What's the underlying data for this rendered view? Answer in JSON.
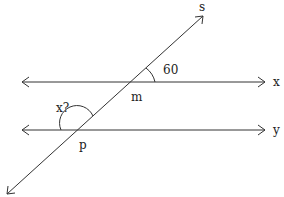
{
  "diagram": {
    "type": "parallel lines cut by a transversal",
    "colors": {
      "line": "#333333",
      "text": "#222222",
      "background": "#ffffff"
    },
    "lines": [
      {
        "id": "x",
        "label": "x",
        "kind": "line (double arrow)",
        "x1": 22,
        "y1": 82,
        "x2": 265,
        "y2": 82
      },
      {
        "id": "y",
        "label": "y",
        "kind": "line (double arrow)",
        "x1": 22,
        "y1": 130,
        "x2": 265,
        "y2": 130
      },
      {
        "id": "s",
        "label": "s",
        "kind": "transversal (double arrow)",
        "x1": 7,
        "y1": 194,
        "x2": 203,
        "y2": 16
      }
    ],
    "points": [
      {
        "id": "m",
        "label": "m",
        "x": 131,
        "y": 82
      },
      {
        "id": "p",
        "label": "p",
        "x": 77,
        "y": 130
      }
    ],
    "angles": [
      {
        "label": "60",
        "at": "m",
        "position": "between line x (right) and transversal s (upper)"
      },
      {
        "label": "x?",
        "at": "p",
        "position": "between line y (left) and transversal s (upper), obtuse"
      }
    ],
    "labels": {
      "s": "s",
      "x": "x",
      "y": "y",
      "m": "m",
      "p": "p",
      "angle_known": "60",
      "angle_unknown": "x?"
    }
  }
}
